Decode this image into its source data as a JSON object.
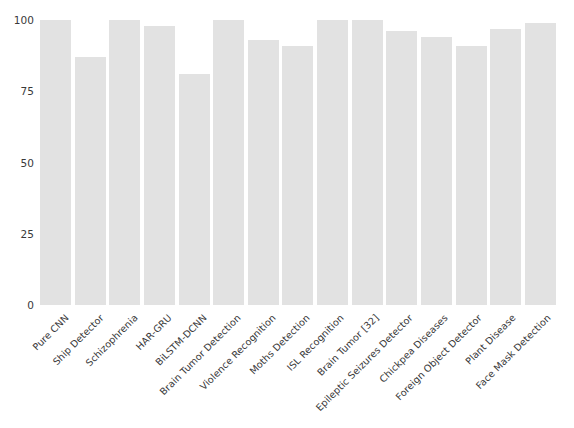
{
  "chart_data": {
    "type": "bar",
    "title": "",
    "subtitle": "",
    "xlabel": "",
    "ylabel": "",
    "ylim": [
      0,
      100
    ],
    "yticks": [
      0,
      25,
      50,
      75,
      100
    ],
    "ytick_labels": [
      "0",
      "25",
      "50",
      "75",
      "100"
    ],
    "grid": false,
    "legend": null,
    "bar_color": "#e2e2e2",
    "categories": [
      "Pure CNN",
      "Ship Detector",
      "Schizophrenia",
      "HAR-GRU",
      "BiLSTM-DCNN",
      "Brain Tumor Detection",
      "Violence Recognition",
      "Moths Detection",
      "ISL Recognition",
      "Brain Tumor [32]",
      "Epileptic Seizures Detector",
      "Chickpea Diseases",
      "Foreign Object Detector",
      "Plant Disease",
      "Face Mask Detection"
    ],
    "values": [
      100,
      87,
      100,
      98,
      81,
      100,
      93,
      91,
      100,
      100,
      96,
      94,
      91,
      97,
      99
    ]
  }
}
